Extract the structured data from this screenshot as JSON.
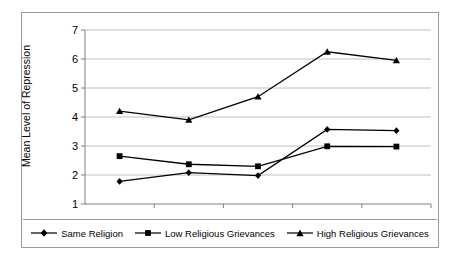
{
  "chart_data": {
    "type": "line",
    "title": "",
    "xlabel": "",
    "ylabel": "Mean Level of Repression",
    "categories": [
      "1996",
      "1997",
      "1998",
      "1999",
      "2000"
    ],
    "ylim": [
      1,
      7
    ],
    "yticks": [
      1,
      2,
      3,
      4,
      5,
      6,
      7
    ],
    "ytick_labels": [
      "1",
      "2",
      "3",
      "4",
      "5",
      "6",
      "7"
    ],
    "grid": true,
    "grid_axis": "y",
    "legend_position": "bottom",
    "series": [
      {
        "name": "Same Religion",
        "marker": "diamond",
        "color": "#000000",
        "values": [
          1.78,
          2.08,
          1.98,
          3.57,
          3.53
        ]
      },
      {
        "name": "Low Religious Grievances",
        "marker": "square",
        "color": "#000000",
        "values": [
          2.65,
          2.37,
          2.3,
          2.99,
          2.98
        ]
      },
      {
        "name": "High Religious Grievances",
        "marker": "triangle",
        "color": "#000000",
        "values": [
          4.2,
          3.9,
          4.7,
          6.25,
          5.95
        ]
      }
    ]
  },
  "axis": {
    "y_title": "Mean Level of Repression",
    "y_tick_1": "1",
    "y_tick_2": "2",
    "y_tick_3": "3",
    "y_tick_4": "4",
    "y_tick_5": "5",
    "y_tick_6": "6",
    "y_tick_7": "7",
    "x_tick_1996": "1996",
    "x_tick_1997": "1997",
    "x_tick_1998": "1998",
    "x_tick_1999": "1999",
    "x_tick_2000": "2000"
  },
  "legend": {
    "item_0": "Same Religion",
    "item_1": "Low Religious Grievances",
    "item_2": "High Religious Grievances"
  },
  "colors": {
    "series": "#000000",
    "grid": "#b0b0b0",
    "axis": "#808080",
    "frame": "#9a9a9a",
    "background": "#ffffff"
  }
}
